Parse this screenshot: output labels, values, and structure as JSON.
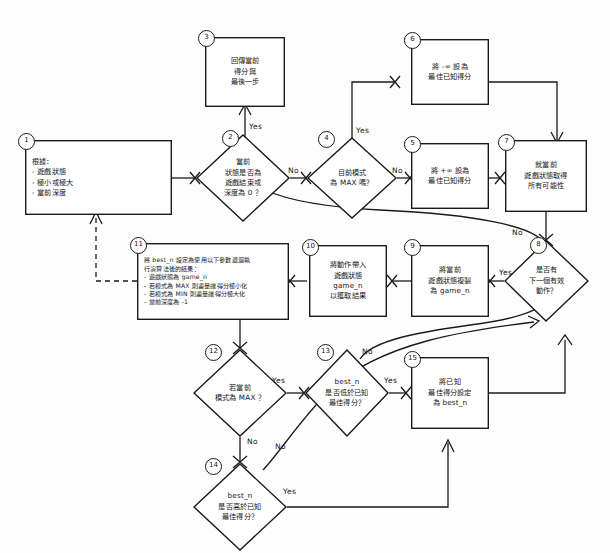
{
  "diagram": {
    "nodes": [
      {
        "id": "1",
        "type": "process",
        "lines": [
          "根據：",
          "- 遊戲狀態",
          "- 極小或極大",
          "- 當前深度"
        ]
      },
      {
        "id": "2",
        "type": "decision",
        "lines": [
          "當前",
          "狀態是否為",
          "遊戲結束或",
          "深度為 0 ？"
        ]
      },
      {
        "id": "3",
        "type": "process",
        "lines": [
          "回傳當前",
          "得分與",
          "最後一步"
        ]
      },
      {
        "id": "4",
        "type": "decision",
        "lines": [
          "目前模式",
          "為 MAX 嗎？"
        ]
      },
      {
        "id": "5",
        "type": "process",
        "lines": [
          "將 +∞ 設為",
          "最佳已知得分"
        ]
      },
      {
        "id": "6",
        "type": "process",
        "lines": [
          "將 -∞ 設為",
          "最佳已知得分"
        ]
      },
      {
        "id": "7",
        "type": "process",
        "lines": [
          "就當前",
          "遊戲狀態取得",
          "所有可能性"
        ]
      },
      {
        "id": "8",
        "type": "decision",
        "lines": [
          "是否有",
          "下一個有效",
          "動作？"
        ]
      },
      {
        "id": "9",
        "type": "process",
        "lines": [
          "將當前",
          "遊戲狀態複製",
          "為 game_n"
        ]
      },
      {
        "id": "10",
        "type": "process",
        "lines": [
          "將動作帶入",
          "遊戲狀態",
          "game_n",
          "以獲取結果"
        ]
      },
      {
        "id": "11",
        "type": "process",
        "lines": [
          "將 best_n 設定為使用以下參數遞迴執",
          "行演算法後的結果：",
          "- 遊戲狀態為 game_n",
          "- 若模式為 MAX 則盡量讓得分極小化",
          "- 若模式為 MIN 則盡量讓得分極大化",
          "- 當前深度為 -1"
        ]
      },
      {
        "id": "12",
        "type": "decision",
        "lines": [
          "若當前",
          "模式為 MAX ？"
        ]
      },
      {
        "id": "13",
        "type": "decision",
        "lines": [
          "best_n",
          "是否低於已知",
          "最佳得分？"
        ]
      },
      {
        "id": "14",
        "type": "decision",
        "lines": [
          "best_n",
          "是否高於已知",
          "最佳得分？"
        ]
      },
      {
        "id": "15",
        "type": "process",
        "lines": [
          "將已知",
          "最佳得分設定",
          "為 best_n"
        ]
      }
    ],
    "edge_labels": [
      {
        "key": "n2_yes",
        "text": "Yes"
      },
      {
        "key": "n2_no",
        "text": "No"
      },
      {
        "key": "n4_yes",
        "text": "Yes"
      },
      {
        "key": "n4_no",
        "text": "No"
      },
      {
        "key": "n8_no",
        "text": "No"
      },
      {
        "key": "n8_yes",
        "text": "Yes"
      },
      {
        "key": "n12_yes",
        "text": "Yes"
      },
      {
        "key": "n12_no",
        "text": "No"
      },
      {
        "key": "n13_no",
        "text": "No"
      },
      {
        "key": "n13_yes",
        "text": "Yes"
      },
      {
        "key": "n14_no",
        "text": "No"
      },
      {
        "key": "n14_yes",
        "text": "Yes"
      }
    ],
    "colors": {
      "stroke": "#1a1a1a",
      "fill": "#ffffff",
      "background": "#fdfdfd",
      "text": "#161616"
    }
  }
}
